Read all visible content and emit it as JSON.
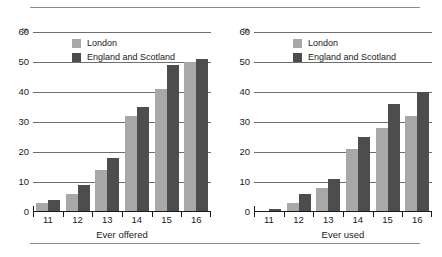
{
  "figure": {
    "unit_symbol": "%",
    "colors": {
      "london": "#a8a8a8",
      "england_and_scotland": "#4d4d4d",
      "gridline": "#6e6e6e",
      "axis": "#1a1a1a",
      "rule": "#8a8a8a"
    }
  },
  "legend": {
    "position": "top-center-inside",
    "entries": [
      {
        "label": "London",
        "color": "#a8a8a8"
      },
      {
        "label": "England and Scotland",
        "color": "#4d4d4d"
      }
    ]
  },
  "yaxis": {
    "ticks": [
      "0",
      "10",
      "20",
      "30",
      "40",
      "50",
      "60"
    ],
    "min": 0,
    "max": 60
  },
  "xaxis": {
    "ticks": [
      "11",
      "12",
      "13",
      "14",
      "15",
      "16"
    ]
  },
  "panels": [
    {
      "id": "ever-offered",
      "title": "Ever offered"
    },
    {
      "id": "ever-used",
      "title": "Ever used"
    }
  ],
  "chart_data": [
    {
      "type": "bar",
      "title": "Ever offered",
      "xlabel": "Ever offered",
      "ylabel": "%",
      "categories": [
        "11",
        "12",
        "13",
        "14",
        "15",
        "16"
      ],
      "series": [
        {
          "name": "London",
          "color": "#a8a8a8",
          "values": [
            3,
            6,
            14,
            32,
            41,
            50
          ]
        },
        {
          "name": "England and Scotland",
          "color": "#4d4d4d",
          "values": [
            4,
            9,
            18,
            35,
            49,
            51
          ]
        }
      ],
      "ylim": [
        0,
        60
      ],
      "yticks": [
        0,
        10,
        20,
        30,
        40,
        50,
        60
      ],
      "grid": true,
      "legend": "top-center"
    },
    {
      "type": "bar",
      "title": "Ever used",
      "xlabel": "Ever used",
      "ylabel": "%",
      "categories": [
        "11",
        "12",
        "13",
        "14",
        "15",
        "16"
      ],
      "series": [
        {
          "name": "London",
          "color": "#a8a8a8",
          "values": [
            0.5,
            3,
            8,
            21,
            28,
            32
          ]
        },
        {
          "name": "England and Scotland",
          "color": "#4d4d4d",
          "values": [
            1,
            6,
            11,
            25,
            36,
            40
          ]
        }
      ],
      "ylim": [
        0,
        60
      ],
      "yticks": [
        0,
        10,
        20,
        30,
        40,
        50,
        60
      ],
      "grid": true,
      "legend": "top-center"
    }
  ]
}
